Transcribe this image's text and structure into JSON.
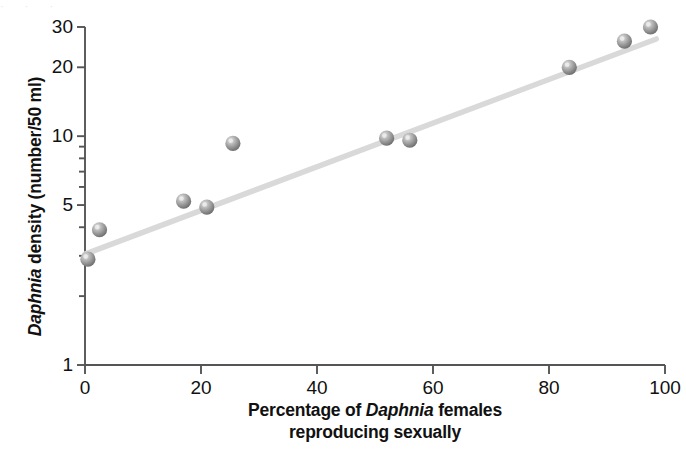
{
  "chart_data": {
    "type": "scatter",
    "title": "",
    "xlabel": "Percentage of Daphnia females reproducing sexually",
    "xlabel_line1_pre": "Percentage of ",
    "xlabel_species": "Daphnia",
    "xlabel_line1_post": " females",
    "xlabel_line2": "reproducing sexually",
    "ylabel": "Daphnia density (number/50 ml)",
    "ylabel_species": "Daphnia",
    "ylabel_rest": " density (number/50 ml)",
    "xlim": [
      0,
      100
    ],
    "ylim": [
      1,
      30
    ],
    "yscale": "log",
    "xscale": "linear",
    "grid": false,
    "legend": "none",
    "xticks": [
      0,
      20,
      40,
      60,
      80,
      100
    ],
    "xtick_labels": [
      "0",
      "20",
      "40",
      "60",
      "80",
      "100"
    ],
    "yticks": [
      1,
      5,
      10,
      20,
      30
    ],
    "ytick_labels": [
      "1",
      "5",
      "10",
      "20",
      "30"
    ],
    "yminor_ticks": [
      2,
      3,
      4,
      6,
      7,
      8,
      9
    ],
    "x": [
      0.5,
      2.5,
      17.0,
      21.0,
      25.5,
      52.0,
      56.0,
      83.5,
      93.0,
      97.5
    ],
    "y": [
      2.9,
      3.9,
      5.2,
      4.9,
      9.3,
      9.8,
      9.6,
      20.0,
      26.0,
      30.0
    ],
    "points": [
      {
        "x": 0.5,
        "y": 2.9
      },
      {
        "x": 2.5,
        "y": 3.9
      },
      {
        "x": 17.0,
        "y": 5.2
      },
      {
        "x": 21.0,
        "y": 4.9
      },
      {
        "x": 25.5,
        "y": 9.3
      },
      {
        "x": 52.0,
        "y": 9.8
      },
      {
        "x": 56.0,
        "y": 9.6
      },
      {
        "x": 83.5,
        "y": 20.0
      },
      {
        "x": 93.0,
        "y": 26.0
      },
      {
        "x": 97.5,
        "y": 30.0
      }
    ],
    "trendline": {
      "x0": 0.0,
      "y0": 3.05,
      "x1": 98.5,
      "y1": 26.6
    },
    "marker_color": "#9a9a9a",
    "trendline_color": "#d9d9d9",
    "axis_color": "#555555"
  },
  "axes": {
    "ytick_labels": [
      "30",
      "20",
      "10",
      "5",
      "1"
    ],
    "xtick_labels": [
      "0",
      "20",
      "40",
      "60",
      "80",
      "100"
    ]
  }
}
